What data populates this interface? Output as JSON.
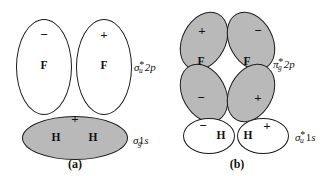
{
  "figure": {
    "width": 331,
    "height": 176,
    "background": "#ffffff",
    "stroke_color": "#1a1a1a",
    "shaded_fill": "#b9b9b9",
    "unshaded_fill": "#ffffff"
  },
  "panel_a": {
    "caption": "(a)",
    "antibonding_2p": {
      "label_sigma": "σ",
      "label_sub": "u",
      "label_star": "*",
      "label_tail": "2p",
      "left_lobe": {
        "sign": "−",
        "atom": "F",
        "shaded": false
      },
      "right_lobe": {
        "sign": "+",
        "atom": "F",
        "shaded": false
      }
    },
    "bonding_1s": {
      "label_sigma": "σ",
      "label_sub": "g",
      "label_star": "",
      "label_tail": "1s",
      "lobe": {
        "sign": "+",
        "atom_left": "H",
        "atom_right": "H",
        "shaded": true
      }
    }
  },
  "panel_b": {
    "caption": "(b)",
    "antibonding_2p": {
      "label_pi": "π",
      "label_sub": "g",
      "label_star": "*",
      "label_tail": "2p",
      "upper_left_lobe": {
        "sign": "+",
        "shaded": true
      },
      "upper_right_lobe": {
        "sign": "−",
        "shaded": true
      },
      "lower_left_lobe": {
        "sign": "−",
        "shaded": true
      },
      "lower_right_lobe": {
        "sign": "+",
        "shaded": true
      },
      "atom_left": "F",
      "atom_right": "F"
    },
    "antibonding_1s": {
      "label_sigma": "σ",
      "label_sub": "u",
      "label_star": "*",
      "label_tail": "1s",
      "left_lobe": {
        "sign": "−",
        "atom": "H",
        "shaded": false
      },
      "right_lobe": {
        "sign": "+",
        "atom": "H",
        "shaded": false
      }
    }
  }
}
